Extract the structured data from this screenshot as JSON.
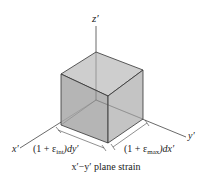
{
  "figure": {
    "caption": "x′−y′ plane strain",
    "axes": {
      "z": "z′",
      "x": "x′",
      "y": "y′"
    },
    "dimensions": {
      "left": {
        "prefix": "(1 + ",
        "symbol": "ε",
        "sub": "int",
        "suffix": ")dy′"
      },
      "right": {
        "prefix": "(1 + ",
        "symbol": "ε",
        "sub": "max",
        "suffix": ")dx′"
      }
    },
    "colors": {
      "top_face": "#c8c8c8",
      "left_face": "#a9a9a9",
      "right_face": "#bcbcbc",
      "edge": "#333333",
      "axis": "#444444"
    }
  }
}
